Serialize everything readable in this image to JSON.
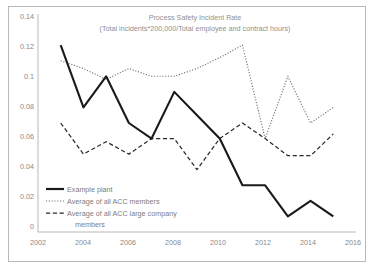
{
  "chart_data": {
    "type": "line",
    "title": "Process Safety Incident Rate",
    "subtitle": "(Total incidents*200,000/Total employee and contract hours)",
    "xlabel": "",
    "ylabel": "",
    "grid": false,
    "legend_position": "inside-bottom-left",
    "xlim": [
      2002,
      2016
    ],
    "ylim": [
      0,
      0.14
    ],
    "xticks": [
      "2002",
      "2004",
      "2006",
      "2008",
      "2010",
      "2012",
      "2014",
      "2016"
    ],
    "xtick_values": [
      2002,
      2004,
      2006,
      2008,
      2010,
      2012,
      2014,
      2016
    ],
    "yticks": [
      "0",
      "0.02",
      "0.04",
      "0.06",
      "0.08",
      "0.1",
      "0.12",
      "0.14"
    ],
    "ytick_values": [
      0,
      0.02,
      0.04,
      0.06,
      0.08,
      0.1,
      0.12,
      0.14
    ],
    "x": [
      2003,
      2004,
      2005,
      2006,
      2007,
      2008,
      2009,
      2010,
      2011,
      2012,
      2013,
      2014,
      2015
    ],
    "series": [
      {
        "name": "Example plant",
        "style": "solid",
        "color": "#1a1a1a",
        "values": [
          0.12,
          0.08,
          0.1,
          0.07,
          0.06,
          0.09,
          0.075,
          0.06,
          0.03,
          0.03,
          0.01,
          0.02,
          0.01
        ]
      },
      {
        "name": "Average of all ACC members",
        "style": "dotted",
        "color": "#6e6e6e",
        "values": [
          0.11,
          0.105,
          0.098,
          0.105,
          0.1,
          0.1,
          0.105,
          0.112,
          0.12,
          0.06,
          0.1,
          0.07,
          0.08
        ]
      },
      {
        "name": "Average of all ACC large company members",
        "style": "dashed",
        "color": "#2a2a2a",
        "values": [
          0.07,
          0.05,
          0.058,
          0.05,
          0.06,
          0.06,
          0.04,
          0.06,
          0.07,
          0.06,
          0.049,
          0.049,
          0.063
        ]
      }
    ]
  },
  "legend": {
    "items": [
      {
        "label": "Example plant"
      },
      {
        "label": "Average of all ACC members"
      },
      {
        "label": "Average of all ACC large company"
      },
      {
        "label": "members"
      }
    ]
  },
  "colors": {
    "frame": "#b9b9b9",
    "axis": "#b0b0b0",
    "text": "#8a8a8a",
    "background": "#ffffff"
  }
}
